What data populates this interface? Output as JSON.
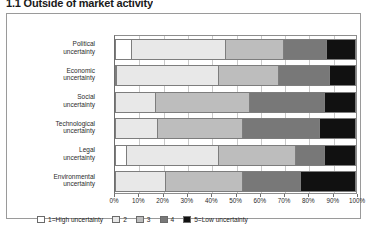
{
  "figure": {
    "title": "1.1 Outside of market activity",
    "width": 369,
    "height": 240
  },
  "legend": {
    "position": "bottom-left",
    "items": [
      {
        "label": "1=High uncertainty",
        "color": "#ffffff"
      },
      {
        "label": "2",
        "color": "#e8e8e8"
      },
      {
        "label": "3",
        "color": "#bdbdbd"
      },
      {
        "label": "4",
        "color": "#787878"
      },
      {
        "label": "5=Low uncertainty",
        "color": "#111111"
      }
    ]
  },
  "axis": {
    "xticks": [
      "0%",
      "10%",
      "20%",
      "30%",
      "40%",
      "50%",
      "60%",
      "70%",
      "80%",
      "90%",
      "100%"
    ],
    "xlim": [
      0,
      100
    ]
  },
  "chart_data": {
    "type": "bar",
    "orientation": "horizontal",
    "stacked": true,
    "normalized": true,
    "title": "1.1 Outside of market activity",
    "xlabel": "",
    "ylabel": "",
    "xlim": [
      0,
      100
    ],
    "grid": true,
    "legend_position": "bottom-left",
    "categories": [
      "Political uncertainty",
      "Economic uncertainty",
      "Social uncertainty",
      "Technological uncertainty",
      "Legal uncertainty",
      "Environmental uncertainty"
    ],
    "series": [
      {
        "name": "1=High uncertainty",
        "color": "#ffffff",
        "values": [
          7,
          1,
          0,
          0,
          5,
          0
        ]
      },
      {
        "name": "2",
        "color": "#e8e8e8",
        "values": [
          39,
          42,
          17,
          18,
          38,
          21
        ]
      },
      {
        "name": "3",
        "color": "#bdbdbd",
        "values": [
          24,
          25,
          39,
          35,
          32,
          32
        ]
      },
      {
        "name": "4",
        "color": "#787878",
        "values": [
          18,
          21,
          31,
          32,
          12,
          24
        ]
      },
      {
        "name": "5=Low uncertainty",
        "color": "#111111",
        "values": [
          12,
          11,
          13,
          15,
          13,
          23
        ]
      }
    ]
  }
}
